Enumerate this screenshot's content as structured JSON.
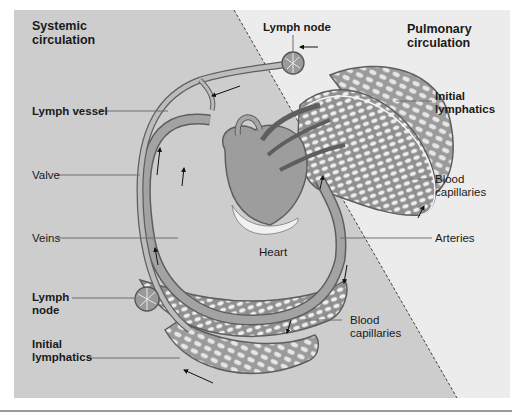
{
  "figure": {
    "regions": {
      "systemic": {
        "title_line1": "Systemic",
        "title_line2": "circulation"
      },
      "pulmonary": {
        "title_line1": "Pulmonary",
        "title_line2": "circulation"
      }
    },
    "labels": {
      "lymph_node_top": "Lymph node",
      "lymph_vessel": "Lymph vessel",
      "valve": "Valve",
      "veins": "Veins",
      "heart": "Heart",
      "lymph_node_left_1": "Lymph",
      "lymph_node_left_2": "node",
      "initial_lymphatics_left_1": "Initial",
      "initial_lymphatics_left_2": "lymphatics",
      "initial_lymphatics_right_1": "Initial",
      "initial_lymphatics_right_2": "lymphatics",
      "blood_capillaries_right_1": "Blood",
      "blood_capillaries_right_2": "capillaries",
      "arteries": "Arteries",
      "blood_capillaries_bottom_1": "Blood",
      "blood_capillaries_bottom_2": "capillaries"
    },
    "colors": {
      "systemic_bg": "#cdcdcd",
      "pulmonary_bg": "#ececec",
      "vessel_fill": "#9a9a9a",
      "vessel_stroke": "#5e5e5e",
      "lymph_fill": "#b9b9b9",
      "mesh_stroke": "#6a6a6a",
      "leader_line": "#6e6e6e"
    }
  }
}
